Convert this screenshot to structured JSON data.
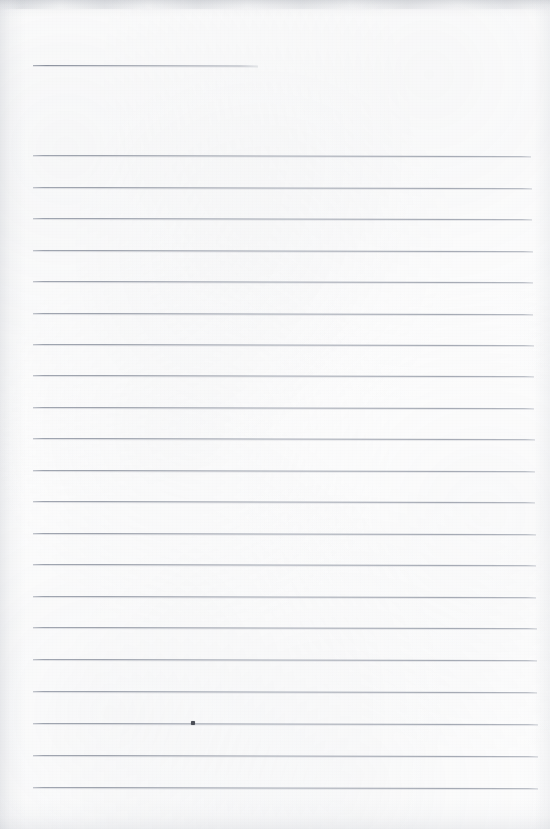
{
  "document": {
    "kind": "scanned-lined-paper",
    "title": "Blank ruled notebook page",
    "width_px": 550,
    "height_px": 829,
    "paper_color": "#fdfdfd",
    "rule_color": "#929aa6",
    "content_text": "",
    "notes": "Empty lined sheet with no handwriting or printed text"
  },
  "ruling": {
    "left_margin_px": 33,
    "right_edge_px": 532,
    "line_spacing_px": 31.4,
    "line_thickness_px": 1,
    "slope_deg": 0.12,
    "total_lines": 22,
    "lines": [
      {
        "id": "line-title",
        "y": 65,
        "x1": 33,
        "x2": 258,
        "variant": "short"
      },
      {
        "id": "line-01",
        "y": 155,
        "x1": 33,
        "x2": 531,
        "variant": "full"
      },
      {
        "id": "line-02",
        "y": 187,
        "x1": 33,
        "x2": 532,
        "variant": "full"
      },
      {
        "id": "line-03",
        "y": 218,
        "x1": 33,
        "x2": 532,
        "variant": "full"
      },
      {
        "id": "line-04",
        "y": 250,
        "x1": 33,
        "x2": 533,
        "variant": "full"
      },
      {
        "id": "line-05",
        "y": 281,
        "x1": 33,
        "x2": 533,
        "variant": "full"
      },
      {
        "id": "line-06",
        "y": 313,
        "x1": 33,
        "x2": 533,
        "variant": "full"
      },
      {
        "id": "line-07",
        "y": 344,
        "x1": 33,
        "x2": 534,
        "variant": "full"
      },
      {
        "id": "line-08",
        "y": 375,
        "x1": 33,
        "x2": 534,
        "variant": "full"
      },
      {
        "id": "line-09",
        "y": 407,
        "x1": 33,
        "x2": 534,
        "variant": "full"
      },
      {
        "id": "line-10",
        "y": 438,
        "x1": 33,
        "x2": 535,
        "variant": "full"
      },
      {
        "id": "line-11",
        "y": 470,
        "x1": 33,
        "x2": 535,
        "variant": "full"
      },
      {
        "id": "line-12",
        "y": 501,
        "x1": 33,
        "x2": 535,
        "variant": "full"
      },
      {
        "id": "line-13",
        "y": 533,
        "x1": 33,
        "x2": 536,
        "variant": "full"
      },
      {
        "id": "line-14",
        "y": 564,
        "x1": 33,
        "x2": 536,
        "variant": "full"
      },
      {
        "id": "line-15",
        "y": 596,
        "x1": 33,
        "x2": 536,
        "variant": "full"
      },
      {
        "id": "line-16",
        "y": 627,
        "x1": 33,
        "x2": 537,
        "variant": "full"
      },
      {
        "id": "line-17",
        "y": 659,
        "x1": 33,
        "x2": 537,
        "variant": "full"
      },
      {
        "id": "line-18",
        "y": 691,
        "x1": 33,
        "x2": 537,
        "variant": "full"
      },
      {
        "id": "line-19",
        "y": 723,
        "x1": 33,
        "x2": 538,
        "variant": "full"
      },
      {
        "id": "line-20",
        "y": 755,
        "x1": 33,
        "x2": 538,
        "variant": "full"
      },
      {
        "id": "line-21",
        "y": 787,
        "x1": 33,
        "x2": 538,
        "variant": "full"
      }
    ]
  },
  "artifacts": {
    "specks": [
      {
        "id": "speck-01",
        "x": 191,
        "y": 721,
        "w": 4,
        "h": 4,
        "color": "#4b4f57"
      }
    ]
  }
}
